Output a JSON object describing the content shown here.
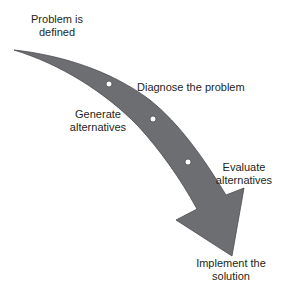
{
  "diagram": {
    "type": "curved-process-arrow",
    "arrow_color": "#6d6e71",
    "arrow_stroke": "#4d4d4f",
    "dot_color": "#ffffff",
    "steps": [
      {
        "id": "defined",
        "line1": "Problem is",
        "line2": "defined"
      },
      {
        "id": "diagnose",
        "line1": "Diagnose the problem"
      },
      {
        "id": "generate",
        "line1": "Generate",
        "line2": "alternatives"
      },
      {
        "id": "evaluate",
        "line1": "Evaluate",
        "line2": "alternatives"
      },
      {
        "id": "implement",
        "line1": "Implement the",
        "line2": "solution"
      }
    ]
  }
}
